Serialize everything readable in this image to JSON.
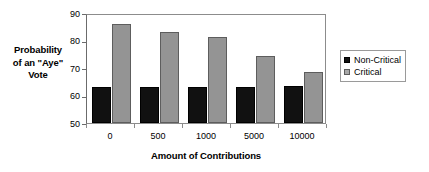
{
  "chart_data": {
    "type": "bar",
    "title": "",
    "xlabel": "Amount of Contributions",
    "ylabel": "Probability of an \"Aye\" Vote",
    "ylabel_lines": [
      "Probability",
      "of an \"Aye\"",
      "Vote"
    ],
    "categories": [
      "0",
      "500",
      "1000",
      "5000",
      "10000"
    ],
    "series": [
      {
        "name": "Non-Critical",
        "color": "#111111",
        "values": [
          63,
          63,
          63,
          63.2,
          63.3
        ]
      },
      {
        "name": "Critical",
        "color": "#949494",
        "values": [
          86,
          83.2,
          81.3,
          74.3,
          68.6
        ]
      }
    ],
    "ylim": [
      50,
      90
    ],
    "yticks": [
      50,
      60,
      70,
      80,
      90
    ],
    "ytick_labels": [
      "50",
      "60",
      "70",
      "80",
      "90"
    ],
    "grid": false,
    "legend_position": "right",
    "legend_entries": [
      {
        "label": "Non-Critical",
        "swatch": "black-square-icon"
      },
      {
        "label": "Critical",
        "swatch": "gray-square-icon"
      }
    ]
  }
}
